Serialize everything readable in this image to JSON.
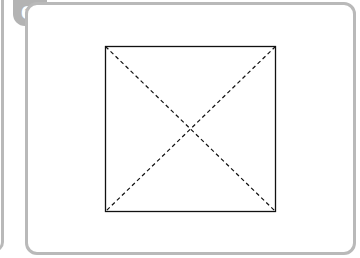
{
  "panel": {
    "number_label": "6."
  },
  "figure": {
    "shape": "square",
    "edges": "solid",
    "diagonals": "dashed",
    "diagonal_count": 2
  },
  "colors": {
    "panel_border": "#b9b9b9",
    "badge_fill": "#b3b3b3",
    "badge_text": "#ffffff",
    "line": "#111111"
  }
}
